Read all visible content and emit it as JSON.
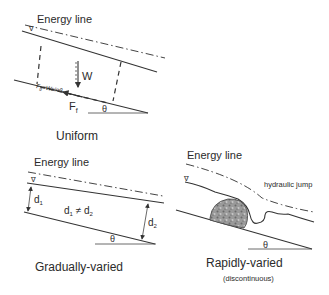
{
  "panels": {
    "uniform": {
      "energy_line_label": "Energy line",
      "title": "Uniform",
      "weight_label": "W",
      "gravity_force_label": "F",
      "gravity_force_sub": "g",
      "gravity_force_eq": "=Wsinθ",
      "friction_force_label": "F",
      "friction_force_sub": "f",
      "angle_label": "θ",
      "water_surface_symbol": "∇"
    },
    "gradually_varied": {
      "energy_line_label": "Energy line",
      "title": "Gradually-varied",
      "depth1_label": "d",
      "depth1_sub": "1",
      "depth2_label": "d",
      "depth2_sub": "2",
      "relation_d1": "d",
      "relation_d1_sub": "1",
      "relation_neq": " ≠ d",
      "relation_d2_sub": "2",
      "angle_label": "θ",
      "water_surface_symbol": "∇"
    },
    "rapidly_varied": {
      "energy_line_label": "Energy line",
      "title": "Rapidly-varied",
      "subtitle": "(discontinuous)",
      "jump_label": "hydraulic jump",
      "angle_label": "θ",
      "water_surface_symbol": "∇"
    }
  }
}
